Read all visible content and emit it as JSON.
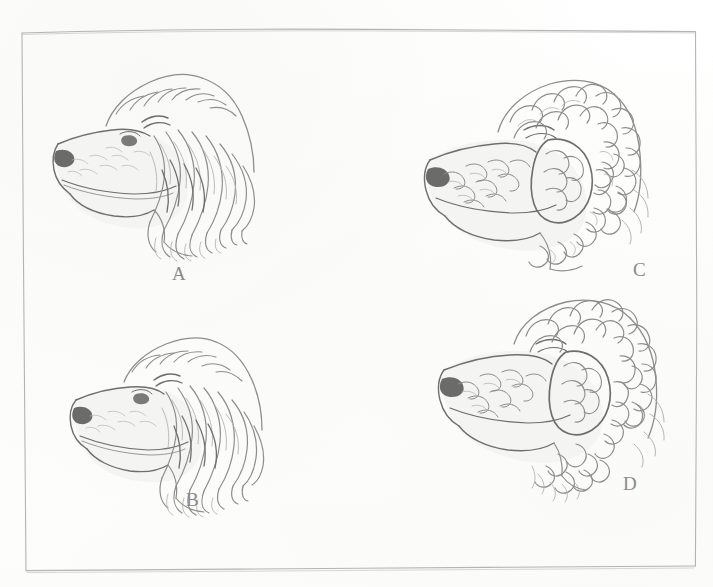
{
  "plate": {
    "kind": "scanned-book-plate",
    "description": "Pencil-sketch plate of four dog head profiles, all facing left, showing varying coat types",
    "background_color": "#ffffff",
    "ink_color": "#8a8a8a",
    "frame": {
      "name": "hand-drawn rectangular border",
      "color": "#a9a9a9",
      "x": 20,
      "y": 29,
      "width": 677,
      "height": 538
    },
    "figures": [
      {
        "id": "A",
        "label": "A",
        "caption_position": "below-center",
        "subject": "dog head profile facing left, long wavy coat, long pendant ear",
        "coat": "long wavy",
        "x": 55,
        "y": 58,
        "width": 215,
        "height": 195,
        "label_x": 172,
        "label_y": 272
      },
      {
        "id": "B",
        "label": "B",
        "caption_position": "below-center",
        "subject": "dog head profile facing left, long wavy coat, slightly smaller head",
        "coat": "long wavy",
        "x": 70,
        "y": 330,
        "width": 205,
        "height": 185,
        "label_x": 186,
        "label_y": 498
      },
      {
        "id": "C",
        "label": "C",
        "caption_position": "below-right",
        "subject": "dog head profile facing left, dense curly coat, curly topknot",
        "coat": "curly",
        "x": 425,
        "y": 68,
        "width": 225,
        "height": 200,
        "label_x": 633,
        "label_y": 268
      },
      {
        "id": "D",
        "label": "D",
        "caption_position": "below-right",
        "subject": "dog head profile facing left, tight curly coat, rounded curly skull",
        "coat": "tight curly",
        "x": 440,
        "y": 300,
        "width": 225,
        "height": 200,
        "label_x": 623,
        "label_y": 482
      }
    ]
  }
}
